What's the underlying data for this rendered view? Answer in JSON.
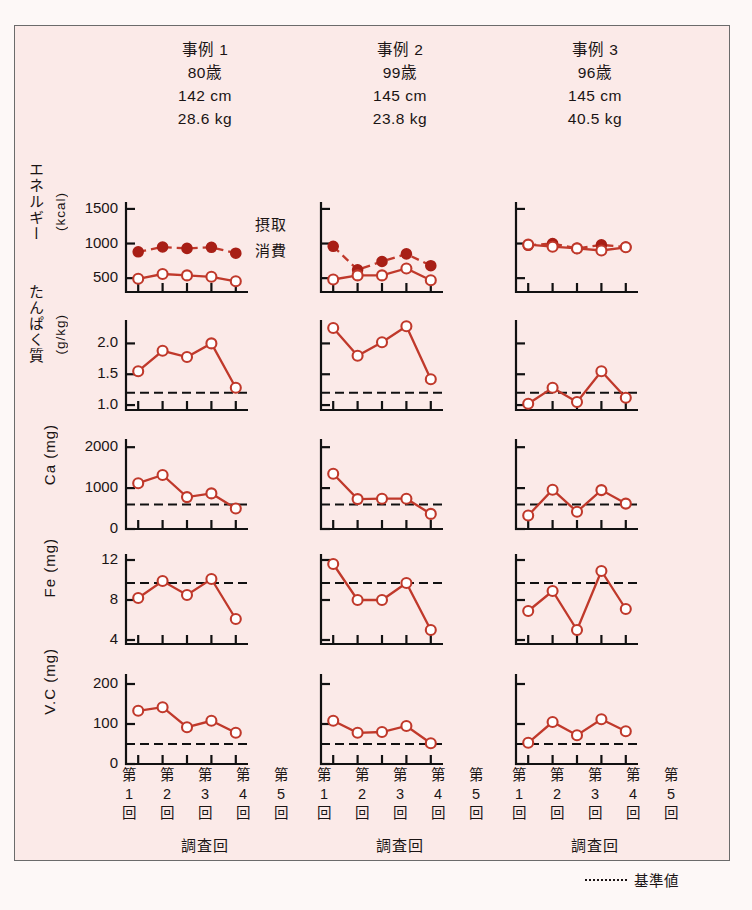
{
  "figure": {
    "background_color": "#fbeae8",
    "line_color": "#c0392b",
    "reference_legend_label": "基準値",
    "reference_legend_marker": "------"
  },
  "cases": [
    {
      "name": "事例 1",
      "age": "80歳",
      "height": "142 cm",
      "weight": "28.6 kg",
      "xaxis_title": "調査回"
    },
    {
      "name": "事例 2",
      "age": "99歳",
      "height": "145 cm",
      "weight": "23.8 kg",
      "xaxis_title": "調査回"
    },
    {
      "name": "事例 3",
      "age": "96歳",
      "height": "145 cm",
      "weight": "40.5 kg",
      "xaxis_title": "調査回"
    }
  ],
  "x_tick_labels": [
    {
      "l1": "第",
      "l2": "1",
      "l3": "回"
    },
    {
      "l1": "第",
      "l2": "2",
      "l3": "回"
    },
    {
      "l1": "第",
      "l2": "3",
      "l3": "回"
    },
    {
      "l1": "第",
      "l2": "4",
      "l3": "回"
    },
    {
      "l1": "第",
      "l2": "5",
      "l3": "回"
    }
  ],
  "energy_legend": {
    "intake": "摂取",
    "expenditure": "消費"
  },
  "row_labels": [
    {
      "name": "エネルギー",
      "unit": "(kcal)"
    },
    {
      "name": "たんぱく質",
      "unit": "(g/kg)"
    },
    {
      "name": "Ca",
      "unit": "(mg)"
    },
    {
      "name": "Fe",
      "unit": "(mg)"
    },
    {
      "name": "V.C",
      "unit": "(mg)"
    }
  ],
  "chart_data": [
    {
      "type": "line",
      "title": "エネルギー (kcal)",
      "ylabel": "エネルギー (kcal)",
      "xlabel": "調査回",
      "categories": [
        "第1回",
        "第2回",
        "第3回",
        "第4回",
        "第5回"
      ],
      "yticks": [
        500,
        1000,
        1500
      ],
      "ylim": [
        300,
        1600
      ],
      "grid": false,
      "panels": [
        {
          "case": "事例 1",
          "series": [
            {
              "name": "摂取",
              "marker": "filled-circle",
              "linestyle": "dashed",
              "values": [
                880,
                950,
                930,
                945,
                860
              ]
            },
            {
              "name": "消費",
              "marker": "open-circle",
              "linestyle": "solid",
              "values": [
                490,
                560,
                540,
                520,
                455
              ]
            }
          ]
        },
        {
          "case": "事例 2",
          "series": [
            {
              "name": "摂取",
              "marker": "filled-circle",
              "linestyle": "dashed",
              "values": [
                960,
                620,
                740,
                850,
                680
              ]
            },
            {
              "name": "消費",
              "marker": "open-circle",
              "linestyle": "solid",
              "values": [
                480,
                540,
                540,
                640,
                470
              ]
            }
          ]
        },
        {
          "case": "事例 3",
          "series": [
            {
              "name": "摂取",
              "marker": "filled-circle",
              "linestyle": "dashed",
              "values": [
                975,
                1000,
                930,
                980,
                950
              ]
            },
            {
              "name": "消費",
              "marker": "open-circle",
              "linestyle": "solid",
              "values": [
                985,
                955,
                930,
                900,
                945
              ]
            }
          ]
        }
      ]
    },
    {
      "type": "line",
      "title": "たんぱく質 (g/kg)",
      "ylabel": "たんぱく質 (g/kg)",
      "xlabel": "調査回",
      "categories": [
        "第1回",
        "第2回",
        "第3回",
        "第4回",
        "第5回"
      ],
      "yticks": [
        1.0,
        1.5,
        2.0
      ],
      "ylim": [
        0.92,
        2.38
      ],
      "grid": false,
      "reference_value": 1.2,
      "panels": [
        {
          "case": "事例 1",
          "series": [
            {
              "name": "摂取",
              "marker": "open-circle",
              "linestyle": "solid",
              "values": [
                1.55,
                1.88,
                1.78,
                2.0,
                1.28
              ]
            }
          ]
        },
        {
          "case": "事例 2",
          "series": [
            {
              "name": "摂取",
              "marker": "open-circle",
              "linestyle": "solid",
              "values": [
                2.25,
                1.8,
                2.02,
                2.28,
                1.42
              ]
            }
          ]
        },
        {
          "case": "事例 3",
          "series": [
            {
              "name": "摂取",
              "marker": "open-circle",
              "linestyle": "solid",
              "values": [
                1.02,
                1.28,
                1.05,
                1.55,
                1.12
              ]
            }
          ]
        }
      ]
    },
    {
      "type": "line",
      "title": "Ca (mg)",
      "ylabel": "Ca (mg)",
      "xlabel": "調査回",
      "categories": [
        "第1回",
        "第2回",
        "第3回",
        "第4回",
        "第5回"
      ],
      "yticks": [
        0,
        1000,
        2000
      ],
      "ylim": [
        0,
        2200
      ],
      "grid": false,
      "reference_value": 600,
      "panels": [
        {
          "case": "事例 1",
          "series": [
            {
              "name": "摂取",
              "marker": "open-circle",
              "linestyle": "solid",
              "values": [
                1120,
                1320,
                780,
                870,
                500
              ]
            }
          ]
        },
        {
          "case": "事例 2",
          "series": [
            {
              "name": "摂取",
              "marker": "open-circle",
              "linestyle": "solid",
              "values": [
                1350,
                730,
                740,
                740,
                370
              ]
            }
          ]
        },
        {
          "case": "事例 3",
          "series": [
            {
              "name": "摂取",
              "marker": "open-circle",
              "linestyle": "solid",
              "values": [
                330,
                960,
                420,
                950,
                620
              ]
            }
          ]
        }
      ]
    },
    {
      "type": "line",
      "title": "Fe (mg)",
      "ylabel": "Fe (mg)",
      "xlabel": "調査回",
      "categories": [
        "第1回",
        "第2回",
        "第3回",
        "第4回",
        "第5回"
      ],
      "yticks": [
        4,
        8,
        12
      ],
      "ylim": [
        3.6,
        12.6
      ],
      "grid": false,
      "reference_value": 9.7,
      "panels": [
        {
          "case": "事例 1",
          "series": [
            {
              "name": "摂取",
              "marker": "open-circle",
              "linestyle": "solid",
              "values": [
                8.2,
                9.9,
                8.5,
                10.1,
                6.1
              ]
            }
          ]
        },
        {
          "case": "事例 2",
          "series": [
            {
              "name": "摂取",
              "marker": "open-circle",
              "linestyle": "solid",
              "values": [
                11.6,
                8.0,
                8.0,
                9.7,
                5.0
              ]
            }
          ]
        },
        {
          "case": "事例 3",
          "series": [
            {
              "name": "摂取",
              "marker": "open-circle",
              "linestyle": "solid",
              "values": [
                6.9,
                8.9,
                5.0,
                10.9,
                7.1
              ]
            }
          ]
        }
      ]
    },
    {
      "type": "line",
      "title": "V.C (mg)",
      "ylabel": "V.C (mg)",
      "xlabel": "調査回",
      "categories": [
        "第1回",
        "第2回",
        "第3回",
        "第4回",
        "第5回"
      ],
      "yticks": [
        0,
        100,
        200
      ],
      "ylim": [
        0,
        225
      ],
      "grid": false,
      "reference_value": 50,
      "panels": [
        {
          "case": "事例 1",
          "series": [
            {
              "name": "摂取",
              "marker": "open-circle",
              "linestyle": "solid",
              "values": [
                133,
                142,
                92,
                108,
                78
              ]
            }
          ]
        },
        {
          "case": "事例 2",
          "series": [
            {
              "name": "摂取",
              "marker": "open-circle",
              "linestyle": "solid",
              "values": [
                108,
                78,
                80,
                95,
                52
              ]
            }
          ]
        },
        {
          "case": "事例 3",
          "series": [
            {
              "name": "摂取",
              "marker": "open-circle",
              "linestyle": "solid",
              "values": [
                53,
                105,
                72,
                112,
                82
              ]
            }
          ]
        }
      ]
    }
  ]
}
